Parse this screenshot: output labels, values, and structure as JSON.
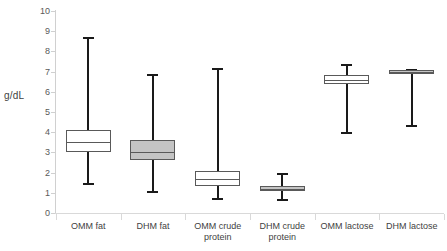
{
  "chart_data": {
    "type": "box",
    "title": "",
    "xlabel": "",
    "ylabel": "g/dL",
    "ylim": [
      0,
      10
    ],
    "ytick_values": [
      0,
      1,
      2,
      3,
      4,
      5,
      6,
      7,
      8,
      9,
      10
    ],
    "ytick_labels": [
      "0",
      "1",
      "2",
      "3",
      "4",
      "5",
      "6",
      "7",
      "8",
      "9",
      "10"
    ],
    "grid": false,
    "legend": "none",
    "categories": [
      "OMM fat",
      "DHM fat",
      "OMM crude protein",
      "DHM crude protein",
      "OMM lactose",
      "DHM lactose"
    ],
    "boxes": [
      {
        "label": "OMM fat",
        "label_line1": "OMM fat",
        "label_line2": "",
        "whisker_low": 1.4,
        "q1": 3.0,
        "median": 3.5,
        "q3": 4.1,
        "whisker_high": 8.7,
        "fill": "#ffffff"
      },
      {
        "label": "DHM fat",
        "label_line1": "DHM fat",
        "label_line2": "",
        "whisker_low": 1.0,
        "q1": 2.6,
        "median": 3.0,
        "q3": 3.6,
        "whisker_high": 6.9,
        "fill": "#c4c4c4"
      },
      {
        "label": "OMM crude protein",
        "label_line1": "OMM crude",
        "label_line2": "protein",
        "whisker_low": 0.65,
        "q1": 1.35,
        "median": 1.7,
        "q3": 2.1,
        "whisker_high": 7.2,
        "fill": "#ffffff"
      },
      {
        "label": "DHM crude protein",
        "label_line1": "DHM crude",
        "label_line2": "protein",
        "whisker_low": 0.6,
        "q1": 1.1,
        "median": 1.2,
        "q3": 1.35,
        "whisker_high": 2.0,
        "fill": "#c4c4c4"
      },
      {
        "label": "OMM lactose",
        "label_line1": "OMM lactose",
        "label_line2": "",
        "whisker_low": 3.9,
        "q1": 6.4,
        "median": 6.6,
        "q3": 6.85,
        "whisker_high": 7.4,
        "fill": "#ffffff"
      },
      {
        "label": "DHM lactose",
        "label_line1": "DHM lactose",
        "label_line2": "",
        "whisker_low": 4.25,
        "q1": 6.9,
        "median": 7.0,
        "q3": 7.1,
        "whisker_high": 7.15,
        "fill": "#c4c4c4"
      }
    ],
    "colors": {
      "box_stroke": "#595959",
      "box_fill_open": "#ffffff",
      "box_fill_shaded": "#c4c4c4",
      "whisker": "#1a1a1a",
      "axis": "#d0d0d0",
      "tick_text": "#595959",
      "label_text": "#3f3f3f",
      "background": "#ffffff"
    }
  }
}
